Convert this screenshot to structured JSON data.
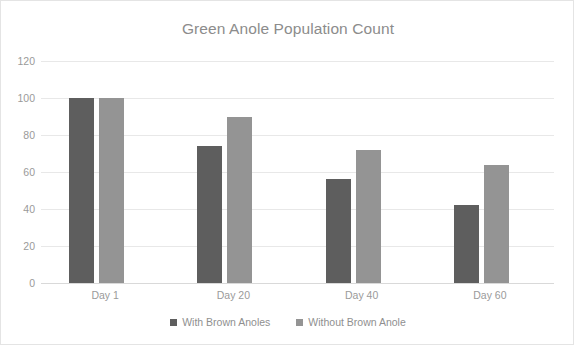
{
  "chart_data": {
    "type": "bar",
    "title": "Green Anole Population Count",
    "xlabel": "",
    "ylabel": "",
    "categories": [
      "Day 1",
      "Day 20",
      "Day 40",
      "Day 60"
    ],
    "series": [
      {
        "name": "With Brown Anoles",
        "color": "#5e5e5e",
        "values": [
          100,
          74,
          56,
          42
        ]
      },
      {
        "name": "Without Brown Anole",
        "color": "#949494",
        "values": [
          100,
          90,
          72,
          64
        ]
      }
    ],
    "ylim": [
      0,
      120
    ],
    "yticks": [
      0,
      20,
      40,
      60,
      80,
      100,
      120
    ],
    "ytick_labels": [
      "0",
      "20",
      "40",
      "60",
      "80",
      "100",
      "120"
    ],
    "grid": "horizontal",
    "legend_position": "bottom-center",
    "plot_background": "#ffffff",
    "gridline_color": "#e8e8e8",
    "axis_text_color": "#9a9a9a",
    "title_color": "#8c8c8c",
    "border_color": "#e4e4e4"
  }
}
